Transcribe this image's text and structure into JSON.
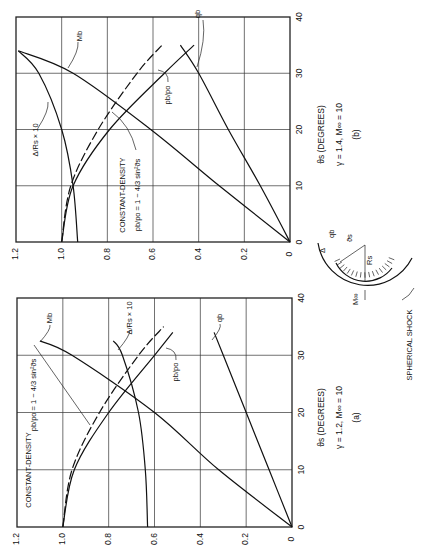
{
  "figure": {
    "panels": [
      {
        "id": "b",
        "caption": "(b)",
        "params": "γ = 1.4,  M∞ = 10",
        "xlabel": "ϑs (DEGREES)"
      },
      {
        "id": "a",
        "caption": "(a)",
        "params": "γ = 1.2,  M∞ = 10",
        "xlabel": "ϑs (DEGREES)"
      }
    ],
    "labels": {
      "mb": "Mb",
      "qb": "qb",
      "pb": "pb/po",
      "delta": "Δ/Rs × 10",
      "const_density": "CONSTANT-DENSITY",
      "const_density_eq": "pb/po = 1 − 4/3 sin²ϑs",
      "spherical_shock": "SPHERICAL SHOCK",
      "minf": "M∞",
      "qb_sketch": "qb",
      "delta_sketch": "Δ",
      "theta_sketch": "ϑs",
      "rs_sketch": "Rs"
    },
    "y_ticks": [
      "1.2",
      "1.0",
      "0.8",
      "0.6",
      "0.4",
      "0.2",
      "0"
    ],
    "x_ticks": [
      "0",
      "10",
      "20",
      "30",
      "40"
    ]
  },
  "chart_data": [
    {
      "type": "line",
      "title": "(b) γ = 1.4, M∞ = 10",
      "xlabel": "ϑs (DEGREES)",
      "ylabel": "",
      "xlim": [
        0,
        40
      ],
      "ylim": [
        0,
        1.2
      ],
      "x_ticks": [
        0,
        10,
        20,
        30,
        40
      ],
      "y_ticks": [
        0,
        0.2,
        0.4,
        0.6,
        0.8,
        1.0,
        1.2
      ],
      "grid": true,
      "orientation": "rotated 90° counter-clockwise",
      "series": [
        {
          "name": "Mb",
          "x": [
            0,
            10,
            20,
            30,
            34
          ],
          "y": [
            0,
            0.31,
            0.61,
            0.95,
            1.19
          ]
        },
        {
          "name": "qb",
          "x": [
            0,
            10,
            20,
            30,
            35
          ],
          "y": [
            0,
            0.13,
            0.27,
            0.4,
            0.48
          ]
        },
        {
          "name": "pb/po",
          "x": [
            0,
            10,
            20,
            30,
            35
          ],
          "y": [
            1.0,
            0.95,
            0.79,
            0.55,
            0.42
          ]
        },
        {
          "name": "CONSTANT-DENSITY pb/po = 1 − 4/3 sin²ϑs",
          "x": [
            0,
            10,
            20,
            30,
            35
          ],
          "y": [
            1.0,
            0.96,
            0.84,
            0.67,
            0.56
          ]
        },
        {
          "name": "Δ/Rs × 10",
          "x": [
            0,
            10,
            20,
            30,
            34
          ],
          "y": [
            0.93,
            0.95,
            1.0,
            1.1,
            1.19
          ]
        }
      ]
    },
    {
      "type": "line",
      "title": "(a) γ = 1.2, M∞ = 10",
      "xlabel": "ϑs (DEGREES)",
      "ylabel": "",
      "xlim": [
        0,
        40
      ],
      "ylim": [
        0,
        1.2
      ],
      "x_ticks": [
        0,
        10,
        20,
        30,
        40
      ],
      "y_ticks": [
        0,
        0.2,
        0.4,
        0.6,
        0.8,
        1.0,
        1.2
      ],
      "grid": true,
      "orientation": "rotated 90° counter-clockwise",
      "series": [
        {
          "name": "Mb",
          "x": [
            0,
            10,
            20,
            30,
            32.5
          ],
          "y": [
            0,
            0.32,
            0.6,
            0.96,
            1.1
          ]
        },
        {
          "name": "qb",
          "x": [
            0,
            10,
            20,
            30,
            34
          ],
          "y": [
            0,
            0.1,
            0.2,
            0.3,
            0.34
          ]
        },
        {
          "name": "pb/po",
          "x": [
            0,
            10,
            20,
            30,
            34
          ],
          "y": [
            1.0,
            0.95,
            0.8,
            0.6,
            0.52
          ]
        },
        {
          "name": "CONSTANT-DENSITY pb/po = 1 − 4/3 sin²ϑs",
          "x": [
            0,
            10,
            20,
            30,
            35
          ],
          "y": [
            1.0,
            0.96,
            0.84,
            0.67,
            0.56
          ]
        },
        {
          "name": "Δ/Rs × 10",
          "x": [
            0,
            10,
            20,
            30,
            32.5
          ],
          "y": [
            0.63,
            0.64,
            0.67,
            0.74,
            0.78
          ]
        }
      ]
    }
  ]
}
